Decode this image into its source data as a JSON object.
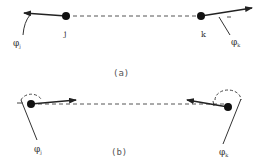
{
  "panels": [
    {
      "id": "a",
      "caption": "(a)",
      "nodes": [
        {
          "id": "j",
          "label": "j",
          "angle_label": "φ",
          "angle_sub": "j"
        },
        {
          "id": "k",
          "label": "k",
          "angle_label": "φ",
          "angle_sub": "k"
        }
      ],
      "description": "Both node vectors point outward, away from each other along the dashed connecting line"
    },
    {
      "id": "b",
      "caption": "(b)",
      "nodes": [
        {
          "id": "j",
          "label": "",
          "angle_label": "φ",
          "angle_sub": "j"
        },
        {
          "id": "k",
          "label": "",
          "angle_label": "φ",
          "angle_sub": "k"
        }
      ],
      "description": "Both node vectors point inward, toward each other along the dashed connecting line"
    }
  ],
  "colors": {
    "ink": "#222222",
    "dashed": "#555555",
    "text": "#333333"
  }
}
